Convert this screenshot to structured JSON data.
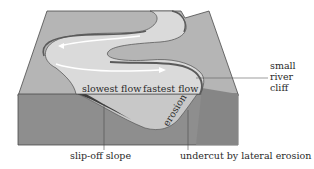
{
  "diagram": {
    "labels": {
      "slowest_flow": "slowest flow",
      "fastest_flow": "fastest flow",
      "erosion": "erosion",
      "small_river_cliff_line1": "small",
      "small_river_cliff_line2": "river",
      "small_river_cliff_line3": "cliff",
      "slip_off_slope": "slip-off slope",
      "undercut": "undercut by lateral erosion"
    },
    "colors": {
      "land_top": "#b4b4b4",
      "front_face": "#8c8c8c",
      "river": "#d9d9d9",
      "bank_dark": "#5a5a5a",
      "flow_arrow": "#ffffff",
      "outline": "#4a4a4a"
    }
  }
}
